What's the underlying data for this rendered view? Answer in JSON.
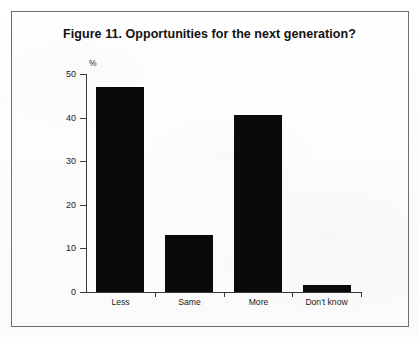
{
  "figure": {
    "title": "Figure 11. Opportunities for the next generation?",
    "frame_color": "#6e6e6e",
    "background_color": "#fdfdfd",
    "bar_color": "#0a0a0a",
    "axis_color": "#3a3a3a"
  },
  "chart_data": {
    "type": "bar",
    "title": "Figure 11. Opportunities for the next generation?",
    "xlabel": "",
    "ylabel": "%",
    "categories": [
      "Less",
      "Same",
      "More",
      "Don't know"
    ],
    "values": [
      47,
      13,
      40.5,
      1.5
    ],
    "ylim": [
      0,
      50
    ],
    "yticks": [
      0,
      10,
      20,
      30,
      40,
      50
    ],
    "ytick_labels": [
      "0",
      "10",
      "20",
      "30",
      "40",
      "50"
    ],
    "grid": false,
    "legend": false,
    "series": [
      {
        "name": "Opportunities for the next generation",
        "values": [
          47,
          13,
          40.5,
          1.5
        ]
      }
    ]
  }
}
